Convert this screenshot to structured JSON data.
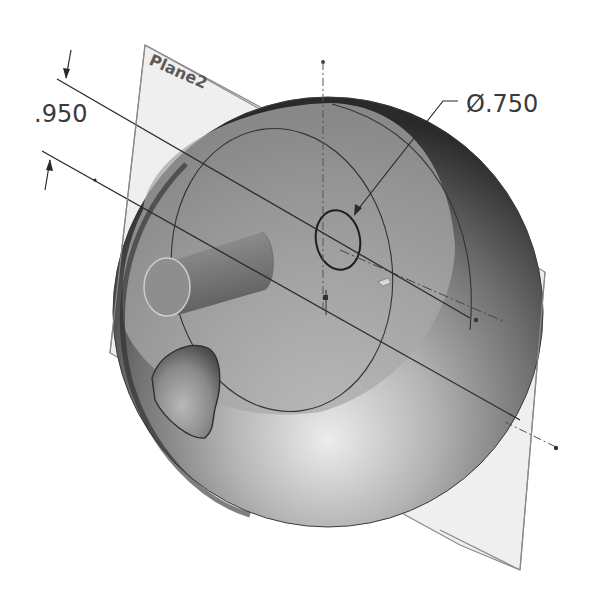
{
  "drawing": {
    "plane_label": "Plane2",
    "dimension_distance": ".950",
    "dimension_diameter": "Ø.750",
    "colors": {
      "background": "#ffffff",
      "plane_fill": "#ececec",
      "plane_edge": "#8a8a8a",
      "sphere_light": "#e8e8e8",
      "sphere_mid": "#8c8c8c",
      "sphere_dark": "#2e2e2e",
      "section_face": "#a6a6a6",
      "line": "#2b2b2b"
    }
  }
}
